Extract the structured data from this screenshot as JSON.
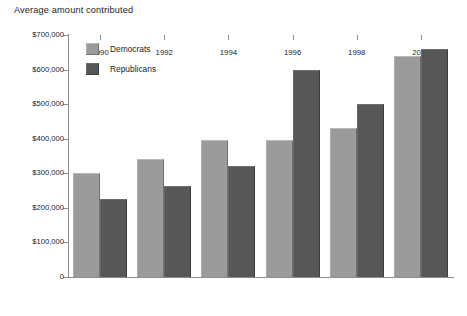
{
  "chart_data": {
    "type": "bar",
    "title": "Average amount contributed",
    "xlabel": "",
    "ylabel": "",
    "categories": [
      "1990",
      "1992",
      "1994",
      "1996",
      "1998",
      "2000"
    ],
    "series": [
      {
        "name": "Democrats",
        "color": "#9b9b9b",
        "values": [
          300000,
          340000,
          395000,
          395000,
          430000,
          640000
        ]
      },
      {
        "name": "Republicans",
        "color": "#575757",
        "values": [
          225000,
          262000,
          322000,
          600000,
          500000,
          660000
        ]
      }
    ],
    "ylim": [
      0,
      700000
    ],
    "ytick_values": [
      0,
      100000,
      200000,
      300000,
      400000,
      500000,
      600000,
      700000
    ],
    "ytick_labels": [
      "0",
      "$100,000",
      "$200,000",
      "$300,000",
      "$400,000",
      "$500,000",
      "$600,000",
      "$700,000"
    ],
    "grid": false,
    "legend_position": "upper-left-inside",
    "legend_entries": [
      "Democrats",
      "Republicans"
    ]
  }
}
